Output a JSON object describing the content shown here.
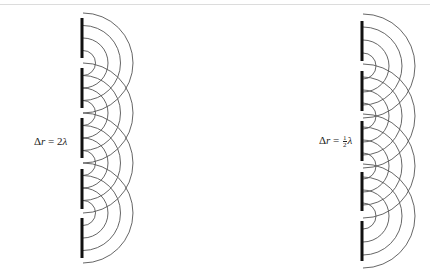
{
  "diagram": {
    "title": "",
    "colors": {
      "barrier": "#111111",
      "wavefront": "#555555",
      "rule": "#dcdcdc"
    },
    "panels": [
      {
        "id": "left",
        "label": {
          "delta": "Δ",
          "var": "r",
          "eq": " = ",
          "coef": "2",
          "lambda": "λ",
          "full": "Δr = 2λ"
        },
        "barrier_x": 82,
        "bar_segments": [
          [
            18,
            58
          ],
          [
            68,
            108
          ],
          [
            118,
            158
          ],
          [
            169,
            209
          ],
          [
            218,
            258
          ]
        ],
        "slits_y": [
          63,
          113,
          163,
          213
        ],
        "wavefront_radii": [
          12.5,
          25,
          37.5,
          50
        ]
      },
      {
        "id": "right",
        "label": {
          "delta": "Δ",
          "var": "r",
          "eq": " = ",
          "num": "1",
          "den": "2",
          "lambda": "λ",
          "full": "Δr = ½λ"
        },
        "barrier_x": 362,
        "bar_segments": [
          [
            21,
            61
          ],
          [
            71,
            111
          ],
          [
            121,
            161
          ],
          [
            172,
            211
          ],
          [
            221,
            261
          ]
        ],
        "slits_y": [
          66,
          116,
          166,
          216
        ],
        "wavefront_radii": [
          13,
          26,
          39,
          52
        ]
      }
    ]
  }
}
